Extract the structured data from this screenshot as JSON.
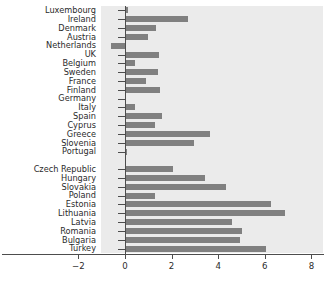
{
  "chart_data": {
    "type": "bar",
    "orientation": "horizontal",
    "title": "",
    "xlabel": "",
    "ylabel": "",
    "xlim": [
      -2,
      8
    ],
    "ylim": [
      0,
      26
    ],
    "grid": false,
    "legend": null,
    "bar_color": "#808080",
    "plot_background": "#ebebeb",
    "axis_color": "#4d4d4d",
    "text_color": "#2b2b2b",
    "xticks": [
      -2,
      0,
      2,
      4,
      6,
      8
    ],
    "xtick_labels": [
      "−2",
      "0",
      "2",
      "4",
      "6",
      "8"
    ],
    "categories": [
      "Luxembourg",
      "Ireland",
      "Denmark",
      "Austria",
      "Netherlands",
      "UK",
      "Belgium",
      "Sweden",
      "France",
      "Finland",
      "Germany",
      "Italy",
      "Spain",
      "Cyprus",
      "Greece",
      "Slovenia",
      "Portugal",
      "",
      "Czech Republic",
      "Hungary",
      "Slovakia",
      "Poland",
      "Estonia",
      "Lithuania",
      "Latvia",
      "Romania",
      "Bulgaria",
      "Turkey"
    ],
    "values": [
      0.15,
      2.7,
      1.35,
      1.0,
      -0.6,
      1.45,
      0.45,
      1.4,
      0.9,
      1.5,
      0.0,
      0.45,
      1.6,
      1.3,
      3.65,
      2.95,
      0.1,
      null,
      2.05,
      3.45,
      4.35,
      1.3,
      6.25,
      6.85,
      4.6,
      5.0,
      4.95,
      6.05
    ]
  }
}
